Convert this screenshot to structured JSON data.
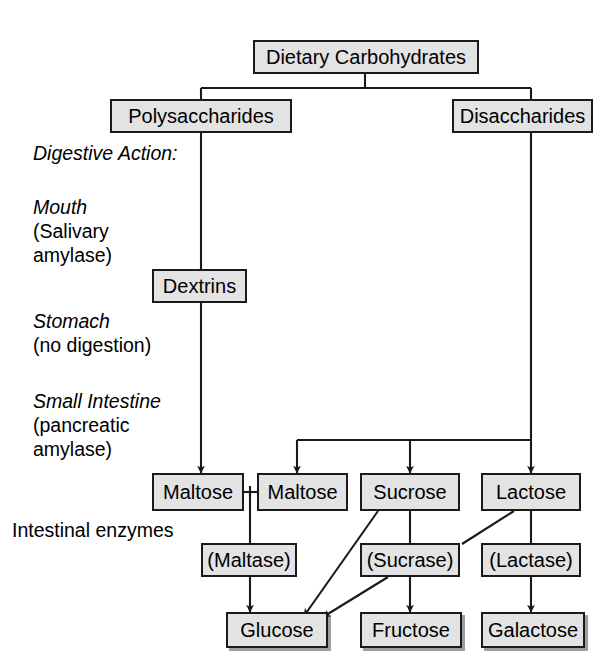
{
  "diagram": {
    "type": "flowchart",
    "palette": {
      "node_fill": "#e3e3e3",
      "node_border": "#1a1a1a",
      "edge": "#1a1a1a",
      "background": "#ffffff",
      "text": "#000000"
    },
    "nodes": {
      "dietary_carbohydrates": "Dietary Carbohydrates",
      "polysaccharides": "Polysaccharides",
      "disaccharides": "Disaccharides",
      "dextrins": "Dextrins",
      "maltose_left": "Maltose",
      "maltose_right": "Maltose",
      "sucrose": "Sucrose",
      "lactose": "Lactose",
      "maltase": "(Maltase)",
      "sucrase": "(Sucrase)",
      "lactase": "(Lactase)",
      "glucose": "Glucose",
      "fructose": "Fructose",
      "galactose": "Galactose"
    },
    "stage_labels": {
      "digestive_action": "Digestive Action:",
      "mouth": "Mouth",
      "mouth_detail_line1": "(Salivary",
      "mouth_detail_line2": "amylase)",
      "stomach": "Stomach",
      "stomach_detail": "(no digestion)",
      "small_intestine": "Small Intestine",
      "small_intestine_detail_line1": "(pancreatic",
      "small_intestine_detail_line2": "amylase)",
      "intestinal_enzymes": "Intestinal enzymes"
    },
    "edges": [
      {
        "from": "dietary_carbohydrates",
        "to": "polysaccharides",
        "style": "elbow"
      },
      {
        "from": "dietary_carbohydrates",
        "to": "disaccharides",
        "style": "elbow"
      },
      {
        "from": "polysaccharides",
        "to": "dextrins",
        "style": "straight"
      },
      {
        "from": "dextrins",
        "to": "maltose_left",
        "style": "arrow"
      },
      {
        "from": "disaccharides",
        "to": "maltose_right",
        "style": "elbow-arrow"
      },
      {
        "from": "disaccharides",
        "to": "sucrose",
        "style": "elbow-arrow"
      },
      {
        "from": "disaccharides",
        "to": "lactose",
        "style": "elbow-arrow"
      },
      {
        "from": "maltose_left",
        "to": "maltase",
        "style": "bracket"
      },
      {
        "from": "maltose_right",
        "to": "maltase",
        "style": "bracket"
      },
      {
        "from": "maltase",
        "to": "glucose",
        "style": "arrow"
      },
      {
        "from": "sucrose",
        "to": "sucrase",
        "style": "straight"
      },
      {
        "from": "sucrose",
        "to": "glucose",
        "style": "diagonal-arrow"
      },
      {
        "from": "sucrase",
        "to": "fructose",
        "style": "arrow"
      },
      {
        "from": "sucrase",
        "to": "glucose",
        "style": "diagonal-arrow"
      },
      {
        "from": "lactose",
        "to": "lactase",
        "style": "straight"
      },
      {
        "from": "lactose",
        "to": "sucrase",
        "style": "diagonal"
      },
      {
        "from": "lactase",
        "to": "galactose",
        "style": "arrow"
      }
    ]
  }
}
